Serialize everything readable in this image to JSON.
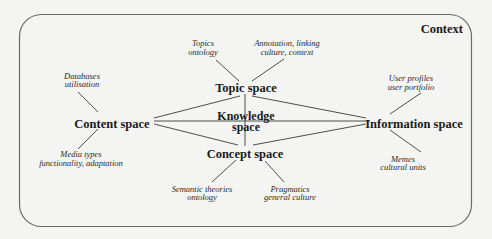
{
  "diagram": {
    "context_label": "Context",
    "nodes": {
      "topic": {
        "label": "Topic space"
      },
      "knowledge": {
        "label_line1": "Knowledge",
        "label_line2": "space"
      },
      "content": {
        "label": "Content space"
      },
      "information": {
        "label": "Information space"
      },
      "concept": {
        "label": "Concept space"
      }
    },
    "annotations": {
      "topics_ontology": {
        "line1": "Topics",
        "line2": "ontology",
        "attached_to": "Topic space"
      },
      "annotation_linking": {
        "line1": "Annotation, linking",
        "line2": "culture, context",
        "attached_to": "Topic space"
      },
      "databases": {
        "line1": "Databases",
        "line2": "utilisation",
        "attached_to": "Content space"
      },
      "media_types": {
        "line1": "Media types",
        "line2": "functionality, adaptation",
        "attached_to": "Content space"
      },
      "user_profiles": {
        "line1": "User profiles",
        "line2": "user portfolio",
        "attached_to": "Information space"
      },
      "memes": {
        "line1": "Memes",
        "line2": "cultural units",
        "attached_to": "Information space"
      },
      "semantic_theories": {
        "line1": "Semantic theories",
        "line2": "ontology",
        "attached_to": "Concept space"
      },
      "pragmatics": {
        "line1": "Pragmatics",
        "line2": "general culture",
        "attached_to": "Concept space"
      }
    },
    "edges": [
      [
        "Content space",
        "Topic space"
      ],
      [
        "Content space",
        "Information space"
      ],
      [
        "Content space",
        "Concept space"
      ],
      [
        "Topic space",
        "Information space"
      ],
      [
        "Topic space",
        "Concept space"
      ],
      [
        "Concept space",
        "Information space"
      ]
    ],
    "colors": {
      "background": "#f4f4f2",
      "frame": "#6a6a6a",
      "text": "#1a1a1a",
      "lines": "#3a3a3a"
    }
  }
}
